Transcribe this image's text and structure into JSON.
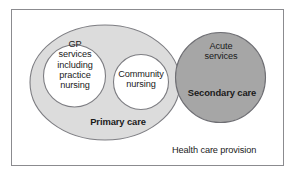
{
  "diagram": {
    "title": "Health care provision",
    "type": "venn-overlap",
    "caption": {
      "text": "Health care provision"
    },
    "regions": [
      {
        "id": "primary-care",
        "label": "Primary care",
        "shape": "ellipse",
        "fill": "#dcdcdc",
        "stroke": "#7d7d82",
        "bold": true
      },
      {
        "id": "gp-services",
        "label": "GP\nservices\nincluding\npractice\nnursing",
        "shape": "circle",
        "fill": "#ffffff",
        "stroke": "#7d7d82",
        "bold": false
      },
      {
        "id": "community-nursing",
        "label": "Community\nnursing",
        "shape": "circle",
        "fill": "#ffffff",
        "stroke": "#7d7d82",
        "bold": false
      },
      {
        "id": "secondary-care",
        "label": "Secondary care",
        "shape": "circle",
        "fill": "#a6a6a6",
        "stroke": "#6e6e73",
        "bold": true
      },
      {
        "id": "acute-services",
        "label": "Acute\nservices",
        "shape": "circle",
        "fill": "#a6a6a6",
        "stroke": "#6e6e73",
        "bold": false
      }
    ],
    "colors": {
      "frame_border": "#8b8b8f",
      "page_background": "#ffffff",
      "primary_fill": "#dcdcdc",
      "secondary_fill": "#a6a6a6",
      "inner_circle_fill": "#ffffff",
      "outline": "#7d7d82",
      "text": "#1a1a1a"
    }
  }
}
